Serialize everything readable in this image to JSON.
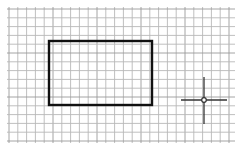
{
  "canvas": {
    "width": 238,
    "height": 148,
    "background": "#ffffff"
  },
  "grid": {
    "x0": 9,
    "y0": 9,
    "x1": 233,
    "y1": 141,
    "spacing": 8.8,
    "color": "#b8b8b8",
    "major_color": "#9a9a9a"
  },
  "rectangle": {
    "x": 49,
    "y": 41,
    "width": 103,
    "height": 64,
    "stroke": "#111111",
    "stroke_width": 2.4
  },
  "crosshair": {
    "cx": 204,
    "cy": 100,
    "h_left": 181,
    "h_right": 227,
    "v_top": 77,
    "v_bottom": 124,
    "color": "#333333",
    "center_radius": 2.3
  }
}
